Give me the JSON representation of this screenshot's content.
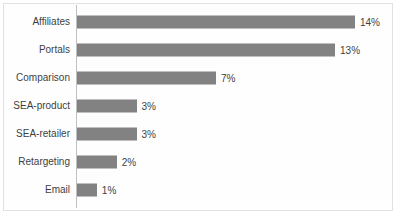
{
  "chart_data": {
    "type": "bar",
    "orientation": "horizontal",
    "title": "",
    "subtitle": "",
    "xlabel": "",
    "ylabel": "",
    "categories": [
      "Affiliates",
      "Portals",
      "Comparison",
      "SEA-product",
      "SEA-retailer",
      "Retargeting",
      "Email"
    ],
    "values": [
      14,
      13,
      7,
      3,
      3,
      2,
      1
    ],
    "value_labels": [
      "14%",
      "13%",
      "7%",
      "3%",
      "3%",
      "2%",
      "1%"
    ],
    "unit": "%",
    "xlim": [
      0,
      14
    ],
    "grid": false,
    "legend": null,
    "tick_labels": [],
    "annotations": []
  },
  "style": {
    "bar_color": "#828282",
    "text_color": "#3f3f3f",
    "axis_color": "#bfbfbf",
    "frame_color": "#e2e2e2",
    "background": "#ffffff"
  }
}
